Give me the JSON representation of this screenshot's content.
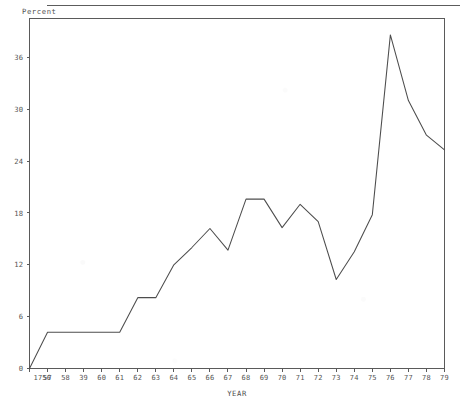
{
  "chart_data": {
    "type": "line",
    "title": "",
    "ylabel": "Percent",
    "xlabel": "YEAR",
    "grid": false,
    "legend": "none",
    "ylim": [
      0,
      40.5
    ],
    "yticks": [
      0,
      6,
      12,
      18,
      24,
      30,
      36
    ],
    "ytick_labels": [
      "0",
      "6",
      "12",
      "18",
      "24",
      "30",
      "36"
    ],
    "xlim": [
      1956,
      1979
    ],
    "x": [
      1956,
      1957,
      1958,
      1959,
      1960,
      1961,
      1962,
      1963,
      1964,
      1965,
      1966,
      1967,
      1968,
      1969,
      1970,
      1971,
      1972,
      1973,
      1974,
      1975,
      1976,
      1977,
      1978,
      1979
    ],
    "xtick_labels": [
      "1756",
      "57",
      "58",
      "39",
      "60",
      "61",
      "62",
      "63",
      "64",
      "65",
      "66",
      "67",
      "68",
      "69",
      "70",
      "71",
      "72",
      "73",
      "74",
      "75",
      "76",
      "77",
      "78",
      "79"
    ],
    "values": [
      0,
      4.2,
      4.2,
      4.2,
      4.2,
      4.2,
      8.2,
      8.2,
      12.0,
      14.0,
      16.2,
      13.7,
      19.6,
      19.6,
      16.3,
      19.0,
      17.0,
      10.3,
      13.5,
      17.8,
      38.6,
      31.0,
      27.0,
      25.3
    ],
    "series_name": "Percent",
    "line_color": "#4d4d4d",
    "axis_color": "#5a5a5a",
    "background_color": "#ffffff"
  }
}
